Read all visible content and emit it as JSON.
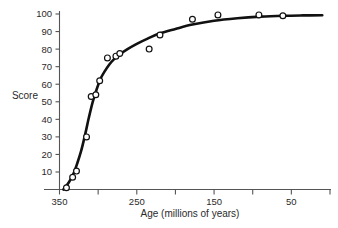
{
  "chart_data": {
    "type": "scatter",
    "title": "",
    "subtitle": "",
    "xlabel": "Age (millions of years)",
    "ylabel": "Score",
    "xlim": [
      350,
      0
    ],
    "ylim": [
      0,
      103
    ],
    "x_axis_reversed": true,
    "grid": false,
    "legend": null,
    "xticks": [
      350,
      300,
      250,
      200,
      150,
      100,
      50,
      0
    ],
    "xtick_labels": [
      "350",
      "",
      "250",
      "",
      "150",
      "",
      "50",
      ""
    ],
    "yticks": [
      10,
      20,
      30,
      40,
      50,
      60,
      70,
      80,
      90,
      100
    ],
    "ytick_labels": [
      "10",
      "20",
      "30",
      "40",
      "50",
      "60",
      "70",
      "80",
      "90",
      "100"
    ],
    "marker_style": "open-circle",
    "series": [
      {
        "name": "Observed scores",
        "x": [
          341,
          333,
          328,
          315,
          309,
          303,
          298,
          288,
          277,
          272,
          234,
          220,
          178,
          145,
          92,
          61
        ],
        "y": [
          1,
          7,
          10.5,
          30,
          53,
          54,
          62,
          75,
          76,
          77.5,
          80,
          88,
          97,
          99.5,
          99.5,
          99
        ]
      },
      {
        "name": "Fitted curve",
        "type": "line",
        "x": [
          345,
          338,
          332,
          327,
          322,
          317,
          312,
          307,
          302,
          297,
          292,
          286,
          280,
          272,
          262,
          250,
          236,
          220,
          200,
          178,
          150,
          120,
          90,
          60,
          35,
          10
        ],
        "y": [
          0,
          4,
          9,
          15,
          22,
          31,
          41,
          50,
          57,
          63,
          67,
          71,
          74,
          77,
          80,
          83,
          86,
          89,
          91.5,
          94,
          96.2,
          97.6,
          98.5,
          99,
          99.2,
          99.3
        ]
      }
    ]
  },
  "axis": {
    "y_label": "Score",
    "x_label": "Age (millions of years)"
  },
  "colors": {
    "background": "#ffffff",
    "curve": "#111111",
    "marker_fill": "#ffffff",
    "marker_stroke": "#111111",
    "axis": "#555555",
    "text": "#2a2a2a"
  }
}
